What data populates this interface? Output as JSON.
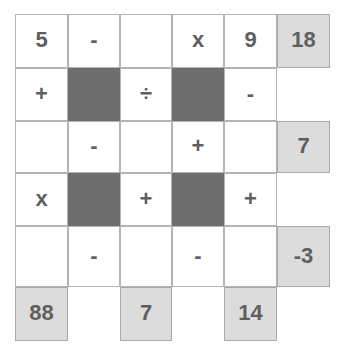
{
  "puzzle": {
    "title": "Arithmetic Cross-Number Grid",
    "rows": 6,
    "cols": 6,
    "colors": {
      "open_cell": "#ffffff",
      "blocked_cell": "#6e6e6e",
      "answer_cell": "#dcdcdc",
      "grid_line": "#b4b4b4",
      "text": "#5f5f5f",
      "page_background": "#ffffff"
    },
    "cells": [
      {
        "r": 0,
        "c": 0,
        "kind": "open",
        "text": "5"
      },
      {
        "r": 0,
        "c": 1,
        "kind": "open",
        "text": "-"
      },
      {
        "r": 0,
        "c": 2,
        "kind": "open",
        "text": ""
      },
      {
        "r": 0,
        "c": 3,
        "kind": "open",
        "text": "x"
      },
      {
        "r": 0,
        "c": 4,
        "kind": "open",
        "text": "9"
      },
      {
        "r": 0,
        "c": 5,
        "kind": "answer",
        "text": "18"
      },
      {
        "r": 1,
        "c": 0,
        "kind": "open",
        "text": "+"
      },
      {
        "r": 1,
        "c": 1,
        "kind": "blocked",
        "text": ""
      },
      {
        "r": 1,
        "c": 2,
        "kind": "open",
        "text": "÷"
      },
      {
        "r": 1,
        "c": 3,
        "kind": "blocked",
        "text": ""
      },
      {
        "r": 1,
        "c": 4,
        "kind": "open",
        "text": "-"
      },
      {
        "r": 1,
        "c": 5,
        "kind": "void",
        "text": ""
      },
      {
        "r": 2,
        "c": 0,
        "kind": "open",
        "text": ""
      },
      {
        "r": 2,
        "c": 1,
        "kind": "open",
        "text": "-"
      },
      {
        "r": 2,
        "c": 2,
        "kind": "open",
        "text": ""
      },
      {
        "r": 2,
        "c": 3,
        "kind": "open",
        "text": "+"
      },
      {
        "r": 2,
        "c": 4,
        "kind": "open",
        "text": ""
      },
      {
        "r": 2,
        "c": 5,
        "kind": "answer",
        "text": "7"
      },
      {
        "r": 3,
        "c": 0,
        "kind": "open",
        "text": "x"
      },
      {
        "r": 3,
        "c": 1,
        "kind": "blocked",
        "text": ""
      },
      {
        "r": 3,
        "c": 2,
        "kind": "open",
        "text": "+"
      },
      {
        "r": 3,
        "c": 3,
        "kind": "blocked",
        "text": ""
      },
      {
        "r": 3,
        "c": 4,
        "kind": "open",
        "text": "+"
      },
      {
        "r": 3,
        "c": 5,
        "kind": "void",
        "text": ""
      },
      {
        "r": 4,
        "c": 0,
        "kind": "open",
        "text": ""
      },
      {
        "r": 4,
        "c": 1,
        "kind": "open",
        "text": "-"
      },
      {
        "r": 4,
        "c": 2,
        "kind": "open",
        "text": ""
      },
      {
        "r": 4,
        "c": 3,
        "kind": "open",
        "text": "-"
      },
      {
        "r": 4,
        "c": 4,
        "kind": "open",
        "text": ""
      },
      {
        "r": 4,
        "c": 5,
        "kind": "answer",
        "text": "-3"
      },
      {
        "r": 5,
        "c": 0,
        "kind": "answer",
        "text": "88"
      },
      {
        "r": 5,
        "c": 1,
        "kind": "void",
        "text": ""
      },
      {
        "r": 5,
        "c": 2,
        "kind": "answer",
        "text": "7"
      },
      {
        "r": 5,
        "c": 3,
        "kind": "void",
        "text": ""
      },
      {
        "r": 5,
        "c": 4,
        "kind": "answer",
        "text": "14"
      },
      {
        "r": 5,
        "c": 5,
        "kind": "void",
        "text": ""
      }
    ],
    "geometry": {
      "col_edges": [
        15,
        68,
        120,
        172,
        224,
        277,
        330
      ],
      "row_edges": [
        14,
        68,
        121,
        173,
        226,
        287,
        341
      ]
    }
  }
}
